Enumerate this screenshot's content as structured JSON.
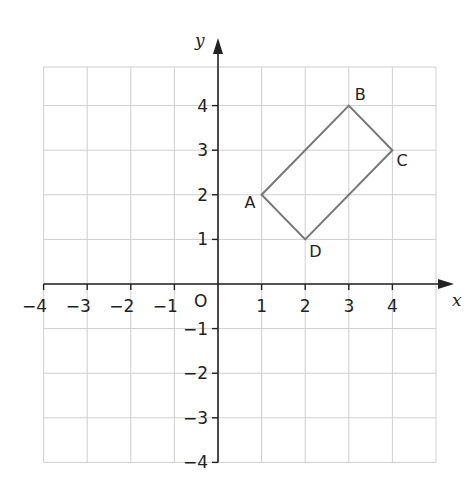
{
  "chart_data": {
    "type": "scatter",
    "title": "",
    "xlabel": "x",
    "ylabel": "y",
    "xlim": [
      -4,
      5
    ],
    "ylim": [
      -4,
      4.5
    ],
    "grid": true,
    "origin_label": "O",
    "x_ticks": [
      -4,
      -3,
      -2,
      -1,
      1,
      2,
      3,
      4
    ],
    "x_tick_labels": [
      "−4",
      "−3",
      "−2",
      "−1",
      "1",
      "2",
      "3",
      "4"
    ],
    "y_ticks": [
      4,
      3,
      2,
      1,
      -1,
      -2,
      -3,
      -4
    ],
    "y_tick_labels": [
      "4",
      "3",
      "2",
      "1",
      "−1",
      "−2",
      "−3",
      "−4"
    ],
    "shape": {
      "name": "rectangle ABCD",
      "points": [
        {
          "label": "A",
          "x": 1,
          "y": 2
        },
        {
          "label": "B",
          "x": 3,
          "y": 4
        },
        {
          "label": "C",
          "x": 4,
          "y": 3
        },
        {
          "label": "D",
          "x": 2,
          "y": 1
        }
      ],
      "stroke": "#777777"
    }
  },
  "colors": {
    "grid": "#cfcfcf",
    "axis": "#222222",
    "shape": "#777777"
  }
}
